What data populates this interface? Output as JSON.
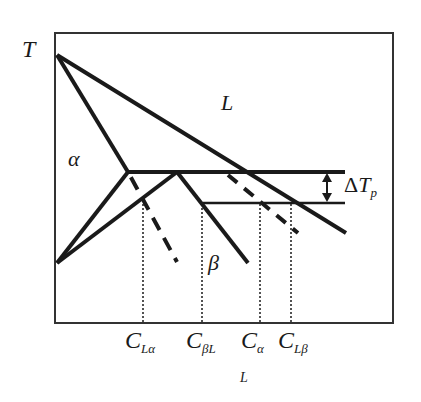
{
  "diagram": {
    "type": "phase-diagram",
    "axis_y_label": "T",
    "axis_x_label": "L",
    "regions": {
      "liquid": "L",
      "alpha": "α",
      "beta": "β"
    },
    "annotation": {
      "delta": "Δ",
      "T": "T",
      "sub": "p"
    },
    "x_ticks": [
      {
        "main": "C",
        "sub": "Lα"
      },
      {
        "main": "C",
        "sub": "βL"
      },
      {
        "main": "C",
        "sub": "α"
      },
      {
        "main": "C",
        "sub": "Lβ"
      }
    ],
    "colors": {
      "line": "#1a1a1a",
      "background": "#ffffff"
    }
  }
}
